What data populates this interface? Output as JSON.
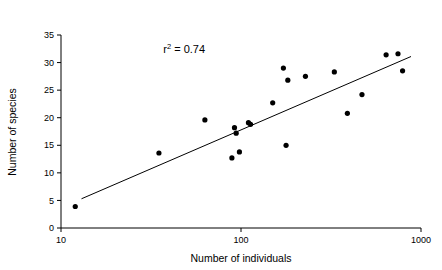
{
  "chart_data": {
    "type": "scatter",
    "title": "",
    "xlabel": "Number of individuals",
    "ylabel": "Number of species",
    "xscale": "log",
    "yscale": "linear",
    "xlim": [
      10,
      1000
    ],
    "ylim": [
      0,
      35
    ],
    "xticks": [
      10,
      100,
      1000
    ],
    "xtick_labels": [
      "10",
      "100",
      "1000"
    ],
    "yticks": [
      0,
      5,
      10,
      15,
      20,
      25,
      30,
      35
    ],
    "ytick_labels": [
      "0",
      "5",
      "10",
      "15",
      "20",
      "25",
      "30",
      "35"
    ],
    "grid": false,
    "legend": null,
    "annotations": [
      {
        "name": "r-squared",
        "text_prefix": "r",
        "text_superscript": "2",
        "text_suffix": " = 0.74",
        "full_text": "r2 = 0.74",
        "value": 0.74,
        "x": 37,
        "y": 31.8
      }
    ],
    "series": [
      {
        "name": "sites",
        "marker": "filled-circle",
        "color": "#000000",
        "marker_size": 5.2,
        "points": [
          {
            "x": 12,
            "y": 3.9
          },
          {
            "x": 35,
            "y": 13.6
          },
          {
            "x": 63,
            "y": 19.6
          },
          {
            "x": 89,
            "y": 12.7
          },
          {
            "x": 92,
            "y": 18.2
          },
          {
            "x": 94,
            "y": 17.2
          },
          {
            "x": 98,
            "y": 13.8
          },
          {
            "x": 110,
            "y": 19.1
          },
          {
            "x": 113,
            "y": 18.8
          },
          {
            "x": 150,
            "y": 22.7
          },
          {
            "x": 172,
            "y": 29.0
          },
          {
            "x": 178,
            "y": 15.0
          },
          {
            "x": 182,
            "y": 26.8
          },
          {
            "x": 228,
            "y": 27.5
          },
          {
            "x": 330,
            "y": 28.3
          },
          {
            "x": 390,
            "y": 20.8
          },
          {
            "x": 470,
            "y": 24.2
          },
          {
            "x": 640,
            "y": 31.4
          },
          {
            "x": 745,
            "y": 31.6
          },
          {
            "x": 790,
            "y": 28.5
          }
        ]
      }
    ],
    "fit_line": {
      "name": "regression-line",
      "color": "#000000",
      "width": 1,
      "x0": 13,
      "y0": 5.3,
      "x1": 880,
      "y1": 31.1
    },
    "axis_color": "#000000"
  }
}
